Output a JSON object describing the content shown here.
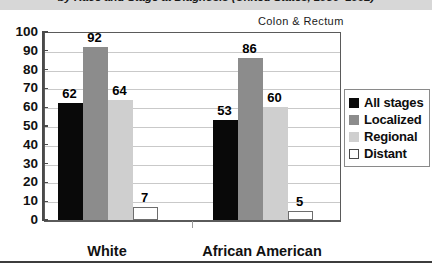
{
  "title": "by Race and Stage at Diagnosis (United States, 1986–1992)",
  "annotation": "Colon & Rectum",
  "legend": {
    "items": [
      {
        "label": "All stages",
        "color": "#090909"
      },
      {
        "label": "Localized",
        "color": "#8c8c8c"
      },
      {
        "label": "Regional",
        "color": "#cfcfcf"
      },
      {
        "label": "Distant",
        "color": "#ffffff"
      }
    ]
  },
  "chart_data": {
    "type": "bar",
    "title": "by Race and Stage at Diagnosis (United States, 1986–1992)",
    "annotation": "Colon & Rectum",
    "categories": [
      "White",
      "African American"
    ],
    "series": [
      {
        "name": "All stages",
        "color": "#090909",
        "values": [
          62,
          53
        ]
      },
      {
        "name": "Localized",
        "color": "#8c8c8c",
        "values": [
          92,
          86
        ]
      },
      {
        "name": "Regional",
        "color": "#cfcfcf",
        "values": [
          64,
          60
        ]
      },
      {
        "name": "Distant",
        "color": "#ffffff",
        "values": [
          7,
          5
        ]
      }
    ],
    "xlabel": "",
    "ylabel": "",
    "ylim": [
      0,
      100
    ],
    "yticks": [
      0,
      10,
      20,
      30,
      40,
      50,
      60,
      70,
      80,
      90,
      100
    ],
    "ytick_labels": [
      "0",
      "10",
      "20",
      "30",
      "40",
      "50",
      "60",
      "70",
      "80",
      "90",
      "100"
    ],
    "grid": true,
    "legend_position": "right",
    "data_labels": true
  }
}
